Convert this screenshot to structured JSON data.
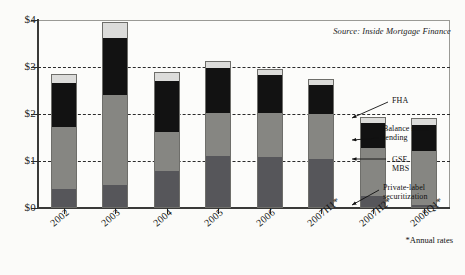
{
  "source_note": "Source:  Inside Mortgage Finance",
  "footnote": "*Annual rates",
  "annotations": [
    {
      "name": "fha",
      "text": "FHA",
      "x": 392,
      "y": 96,
      "lx1": 388,
      "ly1": 102,
      "lx2": 352,
      "ly2": 118
    },
    {
      "name": "balance-sheet-lending",
      "text": "Balance sheet\nlending",
      "x": 383,
      "y": 124,
      "lx1": 379,
      "ly1": 138,
      "lx2": 352,
      "ly2": 140
    },
    {
      "name": "gse-mbs",
      "text": "GSE\nMBS",
      "x": 392,
      "y": 155,
      "lx1": 386,
      "ly1": 159,
      "lx2": 352,
      "ly2": 159
    },
    {
      "name": "private-label-securitization",
      "text": "Private-label\nsecuritization",
      "x": 383,
      "y": 183,
      "lx1": 379,
      "ly1": 190,
      "lx2": 352,
      "ly2": 205
    }
  ],
  "chart_data": {
    "type": "bar",
    "subtype": "stacked",
    "title": "",
    "xlabel": "",
    "ylabel": "",
    "ylim": [
      0,
      4
    ],
    "ytick_values": [
      0,
      1,
      2,
      3,
      4
    ],
    "ytick_labels": [
      "$0",
      "$1",
      "$2",
      "$3",
      "$4"
    ],
    "grid": true,
    "grid_axis": "y",
    "legend_position": "annotations-right",
    "units": "trillions of dollars",
    "categories": [
      "2002",
      "2003",
      "2004",
      "2005",
      "2006",
      "2007H1*",
      "2007H2*",
      "2008Q1*"
    ],
    "series": [
      {
        "name": "Private-label securitization",
        "color": "#56565a",
        "values": [
          0.38,
          0.47,
          0.77,
          1.09,
          1.09,
          1.04,
          0.23,
          0.04
        ]
      },
      {
        "name": "GSE MBS",
        "color": "#868682",
        "values": [
          1.34,
          1.94,
          0.85,
          0.94,
          0.94,
          0.98,
          1.06,
          1.17
        ]
      },
      {
        "name": "Balance sheet lending",
        "color": "#121212",
        "values": [
          0.96,
          1.23,
          1.11,
          0.96,
          0.83,
          0.62,
          0.53,
          0.58
        ]
      },
      {
        "name": "FHA",
        "color": "#dcdcda",
        "values": [
          0.17,
          0.32,
          0.17,
          0.13,
          0.09,
          0.11,
          0.11,
          0.13
        ]
      }
    ],
    "totals": [
      2.85,
      3.96,
      2.9,
      3.11,
      2.94,
      2.74,
      1.94,
      1.94
    ]
  }
}
